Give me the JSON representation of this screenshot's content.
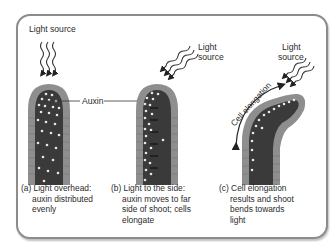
{
  "diagram": {
    "colors": {
      "frame_border": "#8c8c8c",
      "shoot_core": "#3a3a3a",
      "shoot_epidermis": "#8e8e8e",
      "auxin_dot": "#e8e8e8",
      "text": "#2b2b2b"
    },
    "labels": {
      "light_source_a": "Light source",
      "light_source_b_line1": "Light",
      "light_source_b_line2": "source",
      "light_source_c_line1": "Light",
      "light_source_c_line2": "source",
      "auxin": "Auxin",
      "cell_elongation": "Cell elongation"
    },
    "panels": [
      {
        "id": "a",
        "caption_lines": [
          "(a) Light overhead:",
          "auxin distributed",
          "evenly"
        ]
      },
      {
        "id": "b",
        "caption_lines": [
          "(b) Light to the side:",
          "auxin moves to far",
          "side of shoot; cells",
          "elongate"
        ]
      },
      {
        "id": "c",
        "caption_lines": [
          "(c) Cell elongation",
          "results and shoot",
          "bends towards",
          "light"
        ]
      }
    ]
  }
}
